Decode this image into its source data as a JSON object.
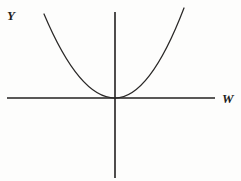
{
  "figure": {
    "background_color": "#fdfdfc",
    "width": 241,
    "height": 181
  },
  "axes": {
    "vertical": {
      "label": "Y",
      "color": "#222020",
      "x": 115,
      "y_top": 12,
      "y_bottom": 178
    },
    "horizontal": {
      "label": "W",
      "color": "#222020",
      "y": 98,
      "x_left": 7,
      "x_right": 215
    },
    "origin": {
      "x": 115,
      "y": 98
    }
  },
  "curve": {
    "name": "parabola",
    "color": "#2a2827",
    "vertex": {
      "x": 115,
      "y": 98
    },
    "left_endpoint": {
      "x": 44,
      "y": 14
    },
    "right_endpoint": {
      "x": 184,
      "y": 8
    },
    "path": "M 44 14 Q 79.5 98 115 98 Q 149.5 98 184 8"
  },
  "chart_data": {
    "type": "line",
    "title": "",
    "xlabel": "W",
    "ylabel": "Y",
    "grid": false,
    "legend": null,
    "annotations": [],
    "series": [
      {
        "name": "parabola",
        "description": "Upward-opening parabola with vertex at the origin, tangent to the W axis",
        "x": [
          -71,
          -60,
          -50,
          -40,
          -30,
          -20,
          -10,
          0,
          10,
          20,
          30,
          40,
          50,
          60,
          69
        ],
        "y": [
          84,
          60,
          42,
          27,
          15,
          7,
          2,
          0,
          2,
          8,
          17,
          30,
          47,
          68,
          90
        ]
      }
    ],
    "xlim": [
      -108,
      100
    ],
    "ylim": [
      -80,
      90
    ]
  }
}
